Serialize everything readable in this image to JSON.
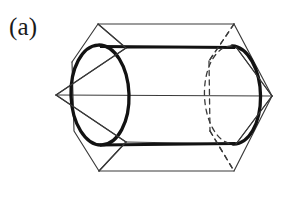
{
  "figure": {
    "panel_label": "(a)",
    "caption_text": "",
    "colors": {
      "background": "#ffffff",
      "prism_edge": "#3a3a3a",
      "cylinder_edge": "#121212",
      "label_text": "#1a1a1a"
    },
    "geometry": {
      "canvas": {
        "width": 293,
        "height": 203
      },
      "cylinder": {
        "left_ellipse": {
          "cx": 100,
          "cy": 95,
          "rx": 29,
          "ry": 50,
          "rotation": -2
        },
        "right_ellipse": {
          "cx": 235,
          "cy": 95,
          "rx": 28,
          "ry": 49,
          "rotation": -2
        },
        "top_rule": {
          "x1": 100,
          "y1": 46,
          "x2": 235,
          "y2": 47
        },
        "bottom_rule": {
          "x1": 100,
          "y1": 145,
          "x2": 235,
          "y2": 144
        }
      },
      "hex_prism_front": {
        "points": "98,24 234,24 272,96 235,171 99,171 56,95"
      },
      "hex_prism_back_visible": {
        "points": "126,48 126,142"
      },
      "axis_line": {
        "x1": 56,
        "y1": 95,
        "x2": 272,
        "y2": 96
      }
    }
  },
  "shapes": {
    "cylinder_name": "cylinder",
    "prism_name": "hexagonal-prism",
    "hidden_edges_name": "hidden-edges-dashed"
  }
}
